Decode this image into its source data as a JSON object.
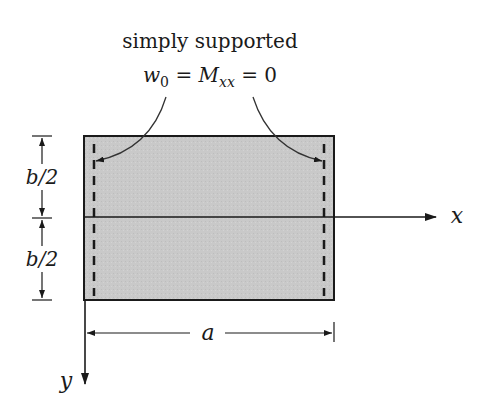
{
  "diagram": {
    "type": "plate_boundary_conditions",
    "caption": {
      "line1": "simply supported",
      "equation": {
        "w": "w",
        "w_sub": "0",
        "eq1": " = ",
        "M": "M",
        "M_sub": "xx",
        "eq2": " = 0"
      }
    },
    "dimensions": {
      "half_height_top": "b/2",
      "half_height_bottom": "b/2",
      "width": "a"
    },
    "axes": {
      "x_label": "x",
      "y_label": "y"
    },
    "colors": {
      "plate_fill": "#c9c9c9",
      "stroke": "#1a1a1a",
      "background": "#ffffff"
    }
  }
}
